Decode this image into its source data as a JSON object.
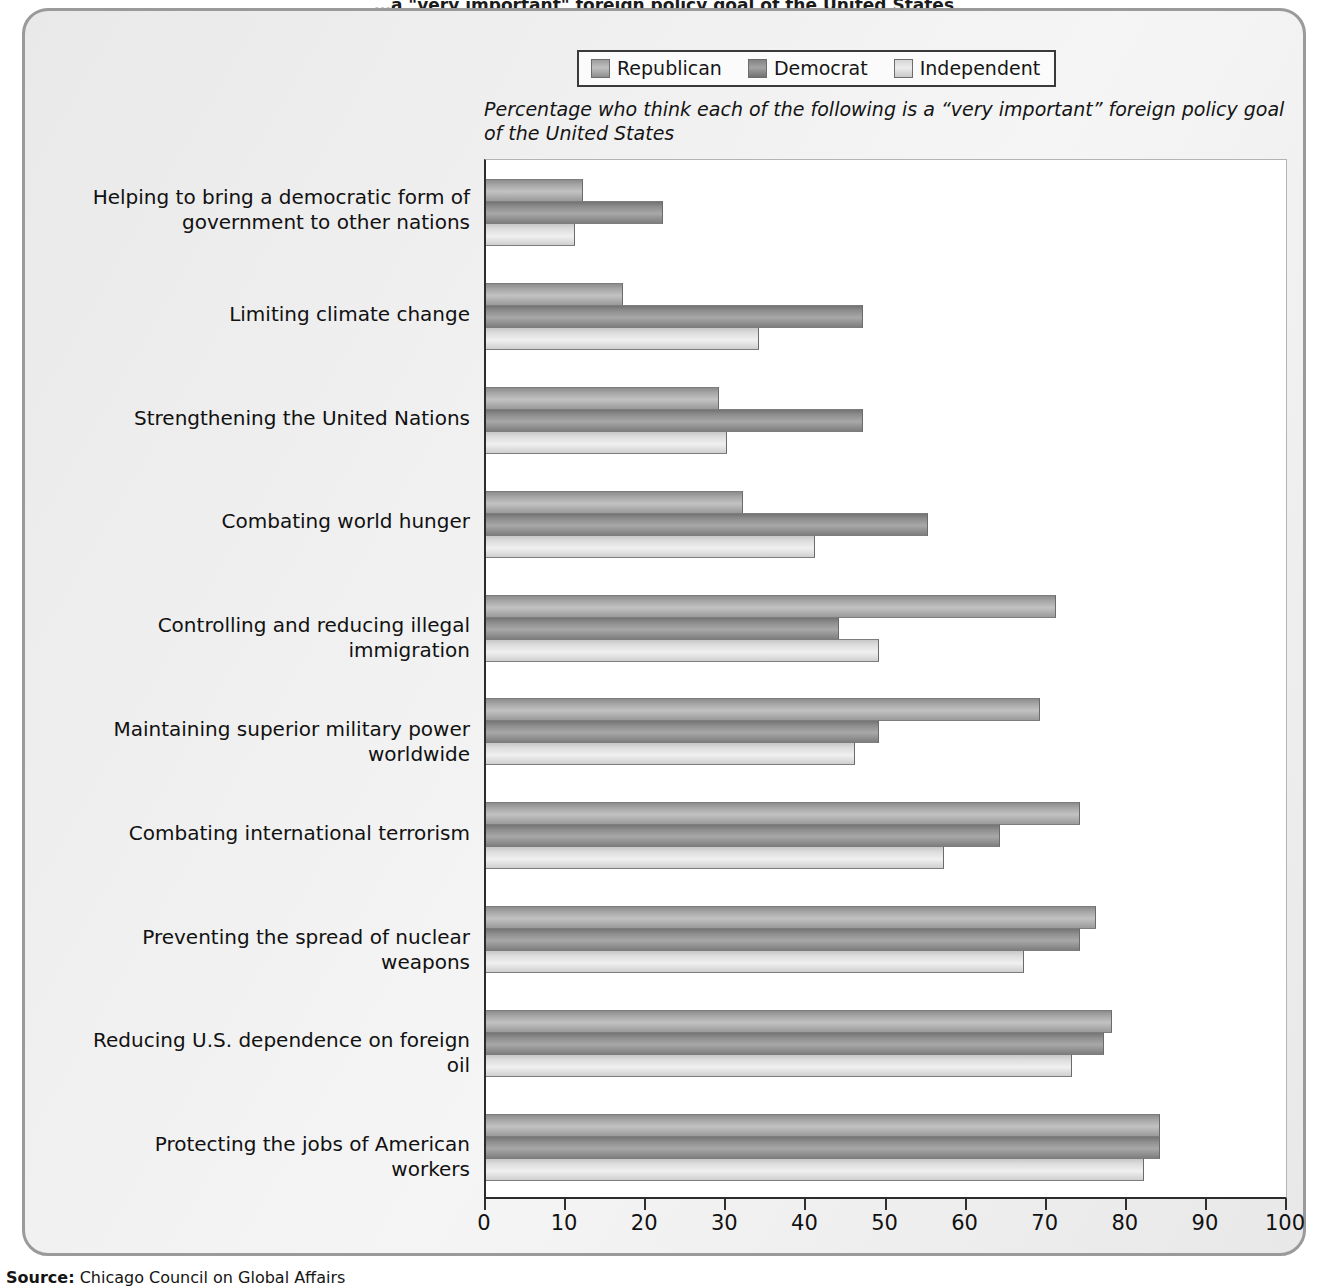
{
  "title": "…a \"very important\" foreign policy goal of the United States",
  "subtitle": "Percentage who think each of the following is a “very important” foreign policy goal of the United States",
  "legend": {
    "items": [
      {
        "label": "Republican",
        "swatch": "republican-swatch",
        "color": "#a8a8a8"
      },
      {
        "label": "Democrat",
        "swatch": "democrat-swatch",
        "color": "#8b8b8b"
      },
      {
        "label": "Independent",
        "swatch": "independent-swatch",
        "color": "#e0e0e0"
      }
    ]
  },
  "source": "Chicago Council on Global Affairs",
  "source_prefix": "Source:",
  "chart_data": {
    "type": "bar",
    "orientation": "horizontal",
    "title": "Percentage who think each of the following is a “very important” foreign policy goal of the United States",
    "xlabel": "",
    "ylabel": "",
    "xlim": [
      0,
      100
    ],
    "xticks": [
      0,
      10,
      20,
      30,
      40,
      50,
      60,
      70,
      80,
      90,
      100
    ],
    "grid": false,
    "legend_position": "top",
    "categories": [
      "Helping to bring a democratic form of government to other nations",
      "Limiting climate change",
      "Strengthening the United Nations",
      "Combating world hunger",
      "Controlling and reducing illegal immigration",
      "Maintaining superior military power worldwide",
      "Combating international terrorism",
      "Preventing the spread of nuclear weapons",
      "Reducing U.S. dependence on foreign oil",
      "Protecting the jobs of American workers"
    ],
    "series": [
      {
        "name": "Republican",
        "values": [
          12,
          17,
          29,
          32,
          71,
          69,
          74,
          76,
          78,
          84
        ]
      },
      {
        "name": "Democrat",
        "values": [
          22,
          47,
          47,
          55,
          44,
          49,
          64,
          74,
          77,
          84
        ]
      },
      {
        "name": "Independent",
        "values": [
          11,
          34,
          30,
          41,
          49,
          46,
          57,
          67,
          73,
          82
        ]
      }
    ]
  }
}
